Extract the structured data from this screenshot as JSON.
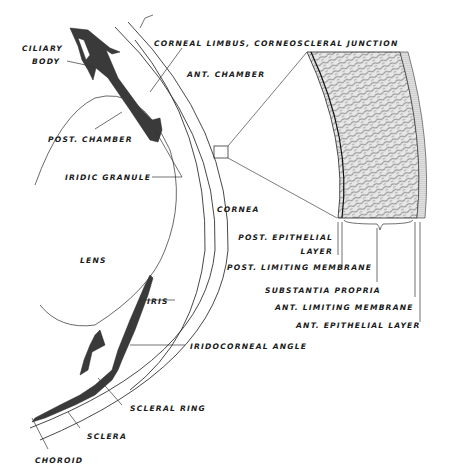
{
  "diagram": {
    "colors": {
      "ink": "#1a1a1a",
      "tissue": "#3a3a3a",
      "background": "#ffffff"
    },
    "labels": {
      "ciliary_body_1": "CILIARY",
      "ciliary_body_2": "BODY",
      "corneal_limbus": "CORNEAL LIMBUS, CORNEOSCLERAL JUNCTION",
      "ant_chamber": "ANT. CHAMBER",
      "post_chamber": "POST. CHAMBER",
      "iridic_granule": "IRIDIC GRANULE",
      "cornea": "CORNEA",
      "lens": "LENS",
      "iris": "IRIS",
      "iridocorneal_angle": "IRIDOCORNEAL ANGLE",
      "scleral_ring": "SCLERAL RING",
      "sclera": "SCLERA",
      "choroid": "CHOROID",
      "post_epithelial_1": "POST. EPITHELIAL",
      "post_epithelial_2": "LAYER",
      "post_limiting": "POST. LIMITING MEMBRANE",
      "substantia_propria": "SUBSTANTIA PROPRIA",
      "ant_limiting": "ANT. LIMITING MEMBRANE",
      "ant_epithelial": "ANT. EPITHELIAL LAYER"
    }
  }
}
